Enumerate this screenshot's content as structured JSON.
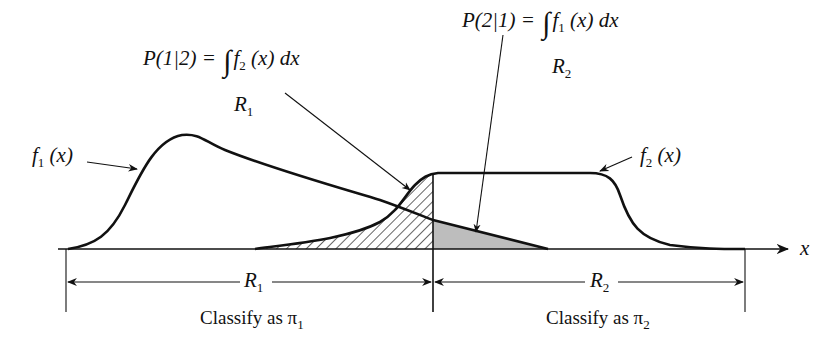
{
  "diagram": {
    "type": "classification-regions",
    "axis_label": "x",
    "curves": [
      {
        "id": "f1",
        "label_fn": "f",
        "label_sub": "1",
        "label_arg": "(x)"
      },
      {
        "id": "f2",
        "label_fn": "f",
        "label_sub": "2",
        "label_arg": "(x)"
      }
    ],
    "formulas": {
      "p12": {
        "lhs": "P(1|2) =",
        "integral": "∫",
        "fn": "f",
        "fn_sub": "2",
        "rest": "(x) dx",
        "region": "R",
        "region_sub": "1"
      },
      "p21": {
        "lhs": "P(2|1) =",
        "integral": "∫",
        "fn": "f",
        "fn_sub": "1",
        "rest": "(x) dx",
        "region": "R",
        "region_sub": "2"
      }
    },
    "regions": [
      {
        "name": "R",
        "sub": "1",
        "classify_text": "Classify as π",
        "classify_sub": "1"
      },
      {
        "name": "R",
        "sub": "2",
        "classify_text": "Classify as π",
        "classify_sub": "2"
      }
    ],
    "colors": {
      "ink": "#111111",
      "shaded_fill": "#bdbdbd",
      "hatch": "#111111",
      "background": "#ffffff"
    }
  }
}
